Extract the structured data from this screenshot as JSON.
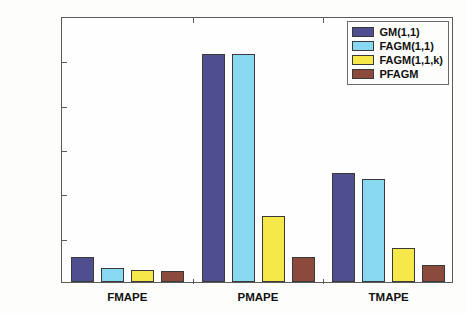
{
  "chart_data": {
    "type": "bar",
    "title": "",
    "xlabel": "",
    "ylabel": "Mean absolute percentage error(%)",
    "categories": [
      "FMAPE",
      "PMAPE",
      "TMAPE"
    ],
    "series": [
      {
        "name": "GM(1,1)",
        "color": "#4f4e8e",
        "values": [
          2.8,
          25.7,
          12.3
        ]
      },
      {
        "name": "FAGM(1,1)",
        "color": "#87d8f0",
        "values": [
          1.6,
          25.75,
          11.6
        ]
      },
      {
        "name": "FAGM(1,1,k)",
        "color": "#f7e84a",
        "values": [
          1.35,
          7.4,
          3.8
        ]
      },
      {
        "name": "PFAGM",
        "color": "#8c4a3c",
        "values": [
          1.2,
          2.8,
          1.9
        ]
      }
    ],
    "ylim": [
      0,
      30
    ],
    "yticks": [
      0,
      5,
      10,
      15,
      20,
      25,
      30
    ],
    "ytick_labels": [
      "0",
      "5",
      "10",
      "15",
      "20",
      "25",
      "30"
    ],
    "grid": false,
    "legend_position": "top-right",
    "legend_entries": [
      "GM(1,1)",
      "FAGM(1,1)",
      "FAGM(1,1,k)",
      "PFAGM"
    ]
  }
}
